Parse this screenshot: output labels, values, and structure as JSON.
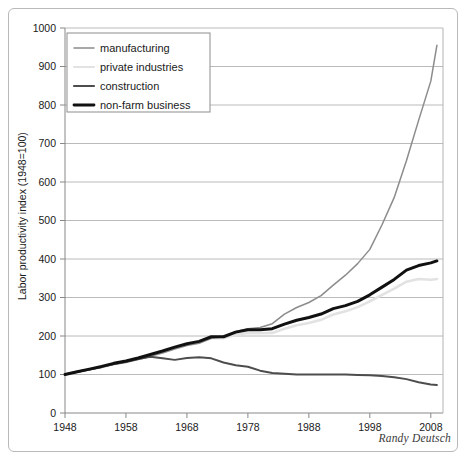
{
  "credit": "Randy Deutsch",
  "legend": {
    "position": "top-left-inside",
    "entries": [
      {
        "label": "manufacturing",
        "color": "#8c8c8c",
        "width": 1.4
      },
      {
        "label": "private industries",
        "color": "#e2e2e2",
        "width": 2.2
      },
      {
        "label": "construction",
        "color": "#4d4d4d",
        "width": 2.2
      },
      {
        "label": "non-farm business",
        "color": "#111111",
        "width": 2.8
      }
    ]
  },
  "chart_data": {
    "type": "line",
    "title": "",
    "xlabel": "",
    "ylabel": "Labor productivity index (1948=100)",
    "xlim": [
      1948,
      2010
    ],
    "ylim": [
      0,
      1000
    ],
    "grid": true,
    "xticks": [
      1948,
      1958,
      1968,
      1978,
      1988,
      1998,
      2008
    ],
    "yticks": [
      0,
      100,
      200,
      300,
      400,
      500,
      600,
      700,
      800,
      900,
      1000
    ],
    "x": [
      1948,
      1950,
      1952,
      1954,
      1956,
      1958,
      1960,
      1962,
      1964,
      1966,
      1968,
      1970,
      1972,
      1974,
      1976,
      1978,
      1980,
      1982,
      1984,
      1986,
      1988,
      1990,
      1992,
      1994,
      1996,
      1998,
      2000,
      2002,
      2004,
      2006,
      2008,
      2009
    ],
    "series": [
      {
        "name": "manufacturing",
        "color": "#8c8c8c",
        "values": [
          100,
          106,
          112,
          118,
          126,
          131,
          139,
          147,
          156,
          166,
          175,
          181,
          194,
          198,
          212,
          219,
          222,
          232,
          257,
          274,
          287,
          305,
          332,
          358,
          388,
          425,
          489,
          560,
          655,
          760,
          862,
          955
        ]
      },
      {
        "name": "private industries",
        "color": "#e2e2e2",
        "values": [
          100,
          107,
          113,
          120,
          128,
          134,
          142,
          150,
          160,
          170,
          178,
          184,
          195,
          194,
          203,
          208,
          207,
          208,
          219,
          228,
          234,
          242,
          256,
          264,
          275,
          290,
          307,
          323,
          341,
          348,
          346,
          348
        ]
      },
      {
        "name": "construction",
        "color": "#4d4d4d",
        "values": [
          100,
          107,
          113,
          120,
          127,
          133,
          140,
          146,
          142,
          138,
          143,
          145,
          142,
          131,
          124,
          120,
          110,
          104,
          102,
          100,
          100,
          100,
          100,
          100,
          99,
          98,
          96,
          93,
          88,
          80,
          74,
          73
        ]
      },
      {
        "name": "non-farm business",
        "color": "#111111",
        "values": [
          100,
          107,
          114,
          121,
          129,
          135,
          143,
          152,
          161,
          171,
          180,
          186,
          198,
          198,
          210,
          216,
          216,
          219,
          231,
          241,
          248,
          257,
          271,
          279,
          290,
          307,
          327,
          347,
          371,
          383,
          390,
          395
        ]
      }
    ],
    "annotations": [
      {
        "text": "manufacturing dip near 2005",
        "x": 2005,
        "y": 840
      }
    ]
  }
}
